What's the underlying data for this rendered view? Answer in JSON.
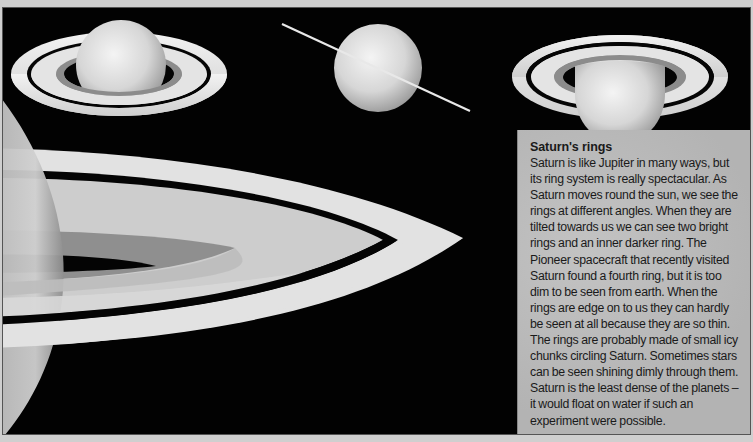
{
  "panel": {
    "title": "Saturn's rings",
    "body": "Saturn is like Jupiter in many ways, but its ring system is really spectacular. As Saturn moves round the sun, we see the rings at different angles. When they are tilted towards us we can see two bright rings and an inner darker ring. The Pioneer spacecraft that recently visited Saturn found a fourth ring, but it is too dim to be seen from earth. When the rings are edge on to us they can hardly be seen at all because they are so thin. The rings are probably made of small icy chunks circling Saturn. Sometimes stars can be seen shining dimly through them. Saturn is the least dense of the planets – it would float on water if such an experiment were possible."
  },
  "illustrations": [
    {
      "name": "saturn-tilted-from-above",
      "view": "rings tilted, seen from above"
    },
    {
      "name": "saturn-edge-on",
      "view": "rings edge on"
    },
    {
      "name": "saturn-tilted-from-below",
      "view": "rings tilted, seen from below"
    },
    {
      "name": "saturn-close-up-rings",
      "view": "close-up of ring system"
    }
  ],
  "colors": {
    "space": "#020202",
    "ring_bright": "#e6e6e6",
    "ring_inner_dark": "#8a8a8a",
    "panel_bg": "#b9b9b9",
    "text": "#1a1a1a"
  }
}
